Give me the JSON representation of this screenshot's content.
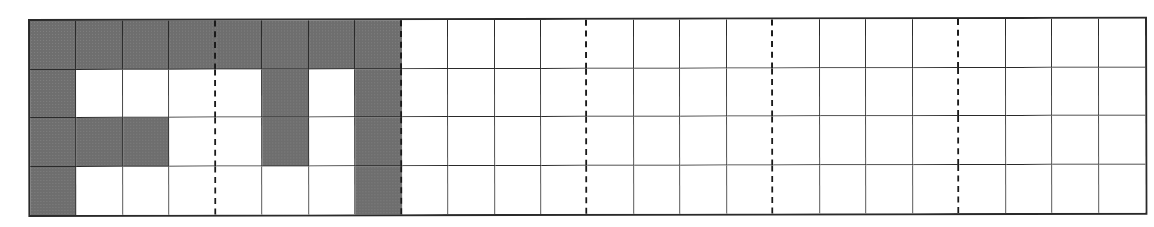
{
  "diagram": {
    "type": "grid",
    "rows": 4,
    "columns": 24,
    "dashed_separator_after_columns": [
      4,
      8,
      12,
      16,
      20
    ],
    "colors": {
      "shaded": "#6e6e6e",
      "empty": "#ffffff",
      "line": "#2a2a2a"
    },
    "shaded_cells": [
      [
        0,
        0
      ],
      [
        0,
        1
      ],
      [
        0,
        2
      ],
      [
        0,
        3
      ],
      [
        0,
        4
      ],
      [
        0,
        5
      ],
      [
        0,
        6
      ],
      [
        0,
        7
      ],
      [
        1,
        0
      ],
      [
        1,
        5
      ],
      [
        1,
        7
      ],
      [
        2,
        0
      ],
      [
        2,
        1
      ],
      [
        2,
        2
      ],
      [
        2,
        5
      ],
      [
        2,
        7
      ],
      [
        3,
        0
      ],
      [
        3,
        7
      ]
    ]
  }
}
